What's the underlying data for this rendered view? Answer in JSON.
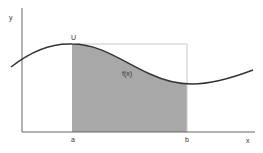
{
  "diagram": {
    "type": "integral-area-under-curve",
    "labels": {
      "y_axis": "y",
      "x_axis": "x",
      "peak": "U",
      "function": "f(x)",
      "lower_bound": "a",
      "upper_bound": "b"
    },
    "colors": {
      "axis": "#666666",
      "curve": "#333333",
      "shaded_area": "#a8a8a8",
      "rectangle_outline": "#c8c8c8",
      "background": "#ffffff"
    }
  }
}
